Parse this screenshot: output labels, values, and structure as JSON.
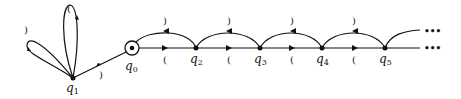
{
  "diagram": {
    "type": "state-transition-automaton",
    "states": [
      {
        "id": "q0",
        "label": "q",
        "sub": "0",
        "start": true
      },
      {
        "id": "q1",
        "label": "q",
        "sub": "1"
      },
      {
        "id": "q2",
        "label": "q",
        "sub": "2"
      },
      {
        "id": "q3",
        "label": "q",
        "sub": "3"
      },
      {
        "id": "q4",
        "label": "q",
        "sub": "4"
      },
      {
        "id": "q5",
        "label": "q",
        "sub": "5"
      }
    ],
    "symbols": {
      "open": "(",
      "close": ")"
    },
    "continuation": "•••",
    "transitions": [
      {
        "from": "q0",
        "to": "q1",
        "label": ")"
      },
      {
        "from": "q1",
        "to": "q1",
        "label": "("
      },
      {
        "from": "q1",
        "to": "q1",
        "label": ")"
      },
      {
        "from": "q0",
        "to": "q2",
        "label": "("
      },
      {
        "from": "q2",
        "to": "q0",
        "label": ")"
      },
      {
        "from": "q2",
        "to": "q3",
        "label": "("
      },
      {
        "from": "q3",
        "to": "q2",
        "label": ")"
      },
      {
        "from": "q3",
        "to": "q4",
        "label": "("
      },
      {
        "from": "q4",
        "to": "q3",
        "label": ")"
      },
      {
        "from": "q4",
        "to": "q5",
        "label": "("
      },
      {
        "from": "q5",
        "to": "q4",
        "label": ")"
      }
    ]
  }
}
